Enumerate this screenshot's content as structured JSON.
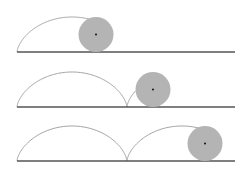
{
  "diagram": {
    "title": "",
    "colors": {
      "background": "#ffffff",
      "baseline": "#555555",
      "curve": "#999999",
      "wheel_fill": "#b4b4b4",
      "wheel_center": "#111111"
    },
    "wheel_radius": 17.5,
    "line_start_x": 17,
    "line_end_x": 235,
    "panels": [
      {
        "id": "stage-1",
        "baseline_y": 52,
        "wheel_center_x": 96,
        "trace_end_t": 3.6
      },
      {
        "id": "stage-2",
        "baseline_y": 107,
        "wheel_center_x": 153,
        "trace_end_t": 7.6
      },
      {
        "id": "stage-3",
        "baseline_y": 161,
        "wheel_center_x": 205,
        "trace_end_t": 10.6
      }
    ]
  }
}
